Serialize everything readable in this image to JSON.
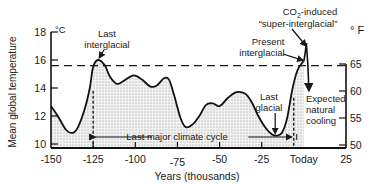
{
  "chart_data": {
    "type": "area",
    "title": "",
    "xlabel": "Years (thousands)",
    "ylabel": "Mean global temperature",
    "y_unit_left": "°C",
    "y_unit_right": "° F",
    "xlim": [
      -150,
      25
    ],
    "ylim": [
      10,
      18
    ],
    "grid": false,
    "x_ticks": [
      {
        "value": -150,
        "label": "-150"
      },
      {
        "value": -125,
        "label": "-125"
      },
      {
        "value": -100,
        "label": "-100"
      },
      {
        "value": -75,
        "label": "-75"
      },
      {
        "value": -50,
        "label": "-50"
      },
      {
        "value": -25,
        "label": "-25"
      },
      {
        "value": 0,
        "label": "Today"
      },
      {
        "value": 25,
        "label": "25"
      }
    ],
    "y_ticks_left": [
      {
        "value": 10,
        "label": "10"
      },
      {
        "value": 12,
        "label": "12"
      },
      {
        "value": 14,
        "label": "14"
      },
      {
        "value": 16,
        "label": "16"
      },
      {
        "value": 18,
        "label": "18"
      }
    ],
    "y_ticks_right": [
      {
        "value": 50,
        "label": "50"
      },
      {
        "value": 55,
        "label": "55"
      },
      {
        "value": 60,
        "label": "60"
      },
      {
        "value": 65,
        "label": "65"
      }
    ],
    "reference_line": {
      "label": "present level",
      "value_c": 15.6
    },
    "series": [
      {
        "name": "Mean global temperature",
        "x": [
          -150,
          -146,
          -141,
          -137,
          -134,
          -130,
          -127,
          -125,
          -122,
          -118,
          -115,
          -111,
          -107,
          -101,
          -96,
          -91,
          -87,
          -83,
          -80,
          -77,
          -73,
          -70,
          -66,
          -62,
          -58,
          -54,
          -50,
          -45,
          -40,
          -35,
          -31,
          -27,
          -23,
          -19,
          -16,
          -13,
          -10,
          -7,
          -4,
          -1,
          0
        ],
        "y": [
          12.7,
          12.0,
          11.0,
          10.8,
          11.2,
          12.5,
          14.0,
          15.5,
          16.0,
          15.6,
          14.8,
          14.3,
          14.5,
          14.9,
          14.6,
          14.1,
          14.2,
          14.7,
          14.6,
          13.5,
          11.8,
          11.2,
          11.4,
          12.0,
          12.8,
          12.9,
          12.7,
          13.3,
          13.7,
          13.6,
          13.0,
          12.0,
          11.2,
          10.7,
          10.6,
          10.8,
          11.8,
          13.8,
          15.2,
          15.8,
          15.9
        ]
      },
      {
        "name": "CO2-induced super-interglacial",
        "x": [
          0,
          1.5
        ],
        "y": [
          15.9,
          17.2
        ]
      },
      {
        "name": "Expected natural cooling",
        "x": [
          0,
          3
        ],
        "y": [
          15.9,
          13.8
        ]
      }
    ],
    "annotations": {
      "last_interglacial": {
        "text_1": "Last",
        "text_2": "interglacial",
        "x": -122,
        "y": 16.0
      },
      "co2": {
        "text_1a": "CO",
        "text_1sub": "2",
        "text_1b": "-induced",
        "text_2": "“super-interglacial”"
      },
      "present": {
        "text_1": "Present",
        "text_2": "interglacial"
      },
      "expected": {
        "text_1": "Expected",
        "text_2": "natural",
        "text_3": "cooling"
      },
      "last_glacial": {
        "text_1": "Last",
        "text_2": "glacial",
        "x": -17,
        "y": 10.6
      },
      "cycle": {
        "text": "Last major climate cycle",
        "from": -125,
        "to": -6
      }
    }
  }
}
